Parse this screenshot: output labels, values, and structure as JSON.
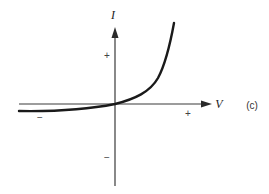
{
  "diagram": {
    "panel_label": "(c)",
    "axes": {
      "y_label": "I",
      "x_label": "V",
      "y_positive_sign": "+",
      "y_negative_sign": "−",
      "x_positive_sign": "+",
      "x_negative_sign": "−"
    },
    "curve": {
      "description": "Exponential diode-like curve: nearly flat slightly negative current for negative V, passes through origin, rises steeply for positive V",
      "color": "#1a1a1a"
    },
    "colors": {
      "axis": "#3a3a3a",
      "background": "#ffffff"
    }
  }
}
